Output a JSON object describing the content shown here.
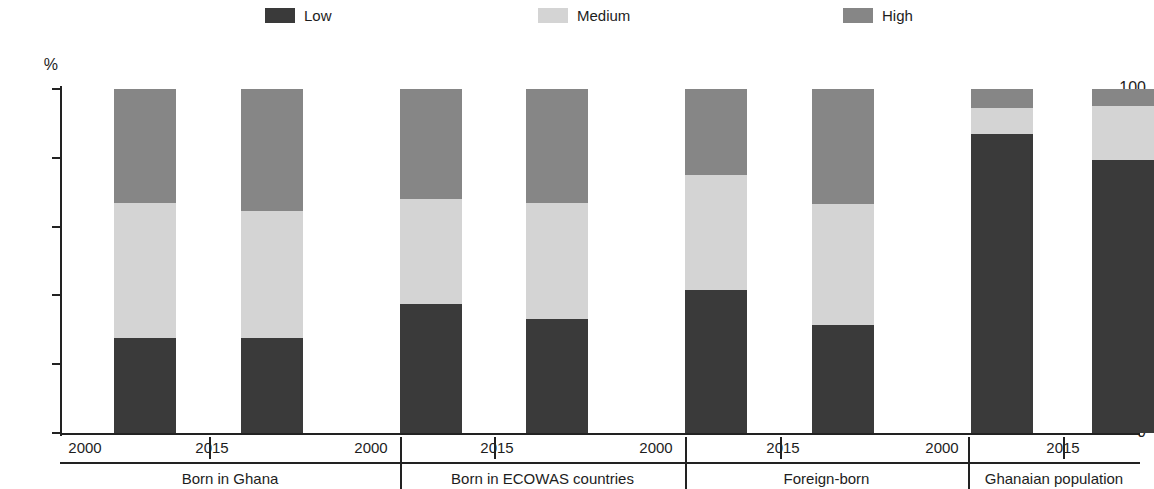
{
  "legend": {
    "position": "top-center",
    "items": [
      {
        "label": "Low",
        "color": "#3a3a3a",
        "left": 265
      },
      {
        "label": "Medium",
        "color": "#d4d4d4",
        "left": 538
      },
      {
        "label": "High",
        "color": "#868686",
        "left": 843
      }
    ]
  },
  "axis": {
    "y_unit": "%",
    "ticks": [
      "100",
      "80",
      "60",
      "40",
      "20",
      "0"
    ],
    "tick_values": [
      100,
      80,
      60,
      40,
      20,
      0
    ]
  },
  "groups": [
    {
      "label": "Born in Ghana",
      "years": [
        "2000",
        "2015"
      ]
    },
    {
      "label": "Born in ECOWAS countries",
      "years": [
        "2000",
        "2015"
      ]
    },
    {
      "label": "Foreign-born",
      "years": [
        "2000",
        "2015"
      ]
    },
    {
      "label": "Ghanaian population",
      "years": [
        "2000",
        "2015"
      ]
    }
  ],
  "chart_data": {
    "type": "bar",
    "subtype": "stacked-100",
    "title": "",
    "xlabel": "",
    "ylabel": "%",
    "ylim": [
      0,
      100
    ],
    "grid": false,
    "legend_position": "top-center",
    "categories": [
      "Born in Ghana 2000",
      "Born in Ghana 2015",
      "Born in ECOWAS countries 2000",
      "Born in ECOWAS countries 2015",
      "Foreign-born 2000",
      "Foreign-born 2015",
      "Ghanaian population 2000",
      "Ghanaian population 2015"
    ],
    "series": [
      {
        "name": "Low",
        "color": "#3a3a3a",
        "values": [
          27.5,
          27.5,
          37.5,
          33.0,
          41.5,
          31.5,
          87.0,
          79.5
        ]
      },
      {
        "name": "Medium",
        "color": "#d4d4d4",
        "values": [
          39.5,
          37.0,
          30.5,
          34.0,
          33.5,
          35.0,
          7.5,
          15.5
        ]
      },
      {
        "name": "High",
        "color": "#868686",
        "values": [
          33.0,
          35.5,
          32.0,
          33.0,
          25.0,
          33.5,
          5.5,
          5.0
        ]
      }
    ]
  }
}
